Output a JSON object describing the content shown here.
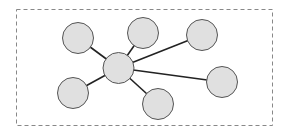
{
  "diagram": {
    "type": "star-network",
    "frame": {
      "x": 16.5,
      "y": 9.5,
      "width": 256,
      "height": 116,
      "stroke": "#888888",
      "dash": "4,3"
    },
    "style": {
      "node_fill": "#e0e0e0",
      "node_stroke": "#555555",
      "edge_stroke": "#222222"
    },
    "hub": {
      "id": "hub",
      "cx": 118.5,
      "cy": 68,
      "r": 15.5
    },
    "nodes": [
      {
        "id": "n1",
        "cx": 78,
        "cy": 38,
        "r": 15.5
      },
      {
        "id": "n2",
        "cx": 143,
        "cy": 33,
        "r": 15.5
      },
      {
        "id": "n3",
        "cx": 202,
        "cy": 35,
        "r": 15.5
      },
      {
        "id": "n4",
        "cx": 222,
        "cy": 82,
        "r": 15.5
      },
      {
        "id": "n5",
        "cx": 158,
        "cy": 104,
        "r": 15.5
      },
      {
        "id": "n6",
        "cx": 73,
        "cy": 93,
        "r": 15.5
      }
    ],
    "edges": [
      [
        "hub",
        "n1"
      ],
      [
        "hub",
        "n2"
      ],
      [
        "hub",
        "n3"
      ],
      [
        "hub",
        "n4"
      ],
      [
        "hub",
        "n5"
      ],
      [
        "hub",
        "n6"
      ]
    ]
  }
}
